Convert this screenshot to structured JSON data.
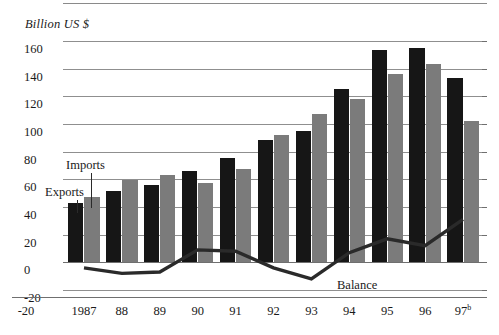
{
  "chart_data": {
    "type": "bar",
    "title": "",
    "subtitle": "",
    "unit_caption": "Billion US $",
    "xlabel": "",
    "ylabel": "Billion US $",
    "ylim": [
      -20,
      160
    ],
    "yticks": [
      160,
      140,
      120,
      100,
      80,
      60,
      40,
      20,
      0,
      -20
    ],
    "ytick_labels": [
      "160",
      "140",
      "120",
      "100",
      "80",
      "60",
      "40",
      "20",
      "0",
      "-20"
    ],
    "grid": true,
    "legend_position": "inline-annotations",
    "categories": [
      "1987",
      "88",
      "89",
      "90",
      "91",
      "92",
      "93",
      "94",
      "95",
      "96",
      "97"
    ],
    "category_labels": [
      "1987",
      "88",
      "89",
      "90",
      "91",
      "92",
      "93",
      "94",
      "95",
      "96",
      "97b"
    ],
    "footnote_marker": "b",
    "series": [
      {
        "name": "Exports",
        "type": "bar",
        "color": "#161616",
        "values": [
          43,
          51,
          56,
          66,
          75,
          88,
          95,
          125,
          153,
          155,
          133
        ]
      },
      {
        "name": "Imports",
        "type": "bar",
        "color": "#7b7b7b",
        "values": [
          47,
          59,
          63,
          57,
          67,
          92,
          107,
          118,
          136,
          143,
          102
        ]
      },
      {
        "name": "Balance",
        "type": "line",
        "color": "#2a2a2a",
        "values": [
          -4,
          -8,
          -7,
          9,
          8,
          -4,
          -12,
          7,
          17,
          12,
          31
        ]
      }
    ],
    "annotations": [
      {
        "text": "Exports",
        "target": "exports-bar-1987"
      },
      {
        "text": "Imports",
        "target": "imports-bar-1987"
      },
      {
        "text": "Balance",
        "target": "balance-line"
      }
    ]
  },
  "axis": {
    "unit_caption": "Billion US $",
    "y_labels": [
      "160",
      "140",
      "120",
      "100",
      "80",
      "60",
      "40",
      "20",
      "0",
      "-20"
    ],
    "x_labels": [
      "-20",
      "1987",
      "88",
      "89",
      "90",
      "91",
      "92",
      "93",
      "94",
      "95",
      "96",
      "97"
    ],
    "x_last_superscript": "b"
  },
  "annotations": {
    "exports": "Exports",
    "imports": "Imports",
    "balance": "Balance"
  },
  "colors": {
    "exports_bar": "#161616",
    "imports_bar": "#7b7b7b",
    "balance_line": "#2a2a2a",
    "gridline": "#8f8f8f",
    "background": "#ffffff"
  }
}
